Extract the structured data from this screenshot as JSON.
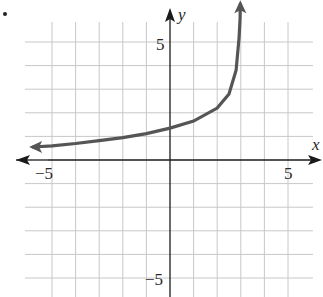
{
  "chart_data": {
    "type": "line",
    "title": "",
    "xlabel": "x",
    "ylabel": "y",
    "xlim": [
      -6.5,
      6.3
    ],
    "ylim": [
      -6,
      6.7
    ],
    "grid": true,
    "x_tick_labels": [
      {
        "value": -5,
        "label": "−5"
      },
      {
        "value": 5,
        "label": "5"
      }
    ],
    "y_tick_labels": [
      {
        "value": 5,
        "label": "5"
      },
      {
        "value": -5,
        "label": "−5"
      }
    ],
    "vertical_asymptote": 3,
    "series": [
      {
        "name": "curve",
        "color": "#555555",
        "arrow_left": true,
        "arrow_top": true,
        "points": [
          {
            "x": -5.8,
            "y": 0.55
          },
          {
            "x": -5,
            "y": 0.6
          },
          {
            "x": -4,
            "y": 0.7
          },
          {
            "x": -3,
            "y": 0.82
          },
          {
            "x": -2,
            "y": 0.95
          },
          {
            "x": -1,
            "y": 1.12
          },
          {
            "x": 0,
            "y": 1.35
          },
          {
            "x": 1,
            "y": 1.65
          },
          {
            "x": 2,
            "y": 2.2
          },
          {
            "x": 2.5,
            "y": 2.8
          },
          {
            "x": 2.8,
            "y": 3.8
          },
          {
            "x": 2.93,
            "y": 5.2
          },
          {
            "x": 2.97,
            "y": 6.0
          },
          {
            "x": 2.98,
            "y": 6.6
          }
        ]
      }
    ]
  },
  "grid": {
    "origin_px": [
      170,
      160
    ],
    "unit_px": 23.6,
    "vertical_lines": [
      -5,
      -4,
      -3,
      -2,
      -1,
      1,
      2,
      3,
      4,
      5
    ],
    "horizontal_lines": [
      -5,
      -4,
      -3,
      -2,
      -1,
      1,
      2,
      3,
      4,
      5
    ],
    "color": "#c8c8c8"
  },
  "labels": {
    "x_axis": "x",
    "y_axis": "y",
    "x_neg5": "−5",
    "x_pos5": "5",
    "y_pos5": "5",
    "y_neg5": "−5"
  }
}
